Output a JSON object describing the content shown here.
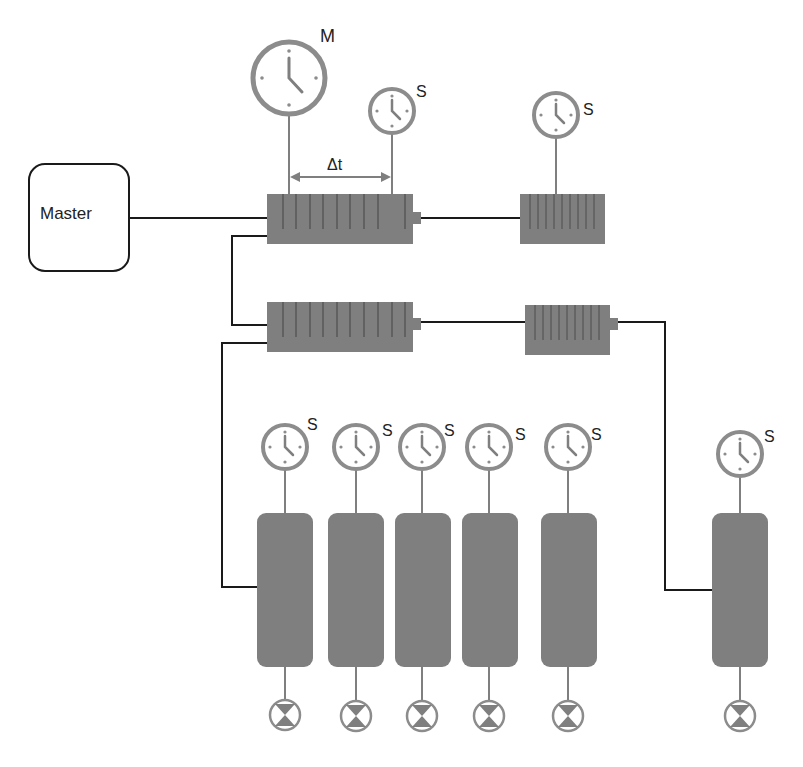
{
  "diagram": {
    "master_label": "Master",
    "delta_label": "Δt",
    "master_clock_label": "M",
    "slave_clock_label": "S",
    "colors": {
      "device_fill": "#7f7f7f",
      "clock_ring": "#8c8c8c",
      "line": "#1a1a1a",
      "clock_line": "#7f7f7f"
    },
    "switches": [
      {
        "id": "switch-1",
        "x": 267,
        "y": 194,
        "w": 146,
        "h": 50,
        "ports": 9
      },
      {
        "id": "switch-2",
        "x": 267,
        "y": 302,
        "w": 146,
        "h": 50,
        "ports": 9
      },
      {
        "id": "switch-3",
        "x": 520,
        "y": 194,
        "w": 85,
        "h": 50,
        "ports": 8
      },
      {
        "id": "switch-4",
        "x": 525,
        "y": 305,
        "w": 85,
        "h": 50,
        "ports": 8
      }
    ],
    "devices": [
      {
        "id": "device-1",
        "x": 257,
        "label": "S"
      },
      {
        "id": "device-2",
        "x": 328,
        "label": "S"
      },
      {
        "id": "device-3",
        "x": 395,
        "label": "S"
      },
      {
        "id": "device-4",
        "x": 462,
        "label": "S"
      },
      {
        "id": "device-5",
        "x": 541,
        "label": "S"
      },
      {
        "id": "device-6",
        "x": 712,
        "label": "S"
      }
    ]
  }
}
